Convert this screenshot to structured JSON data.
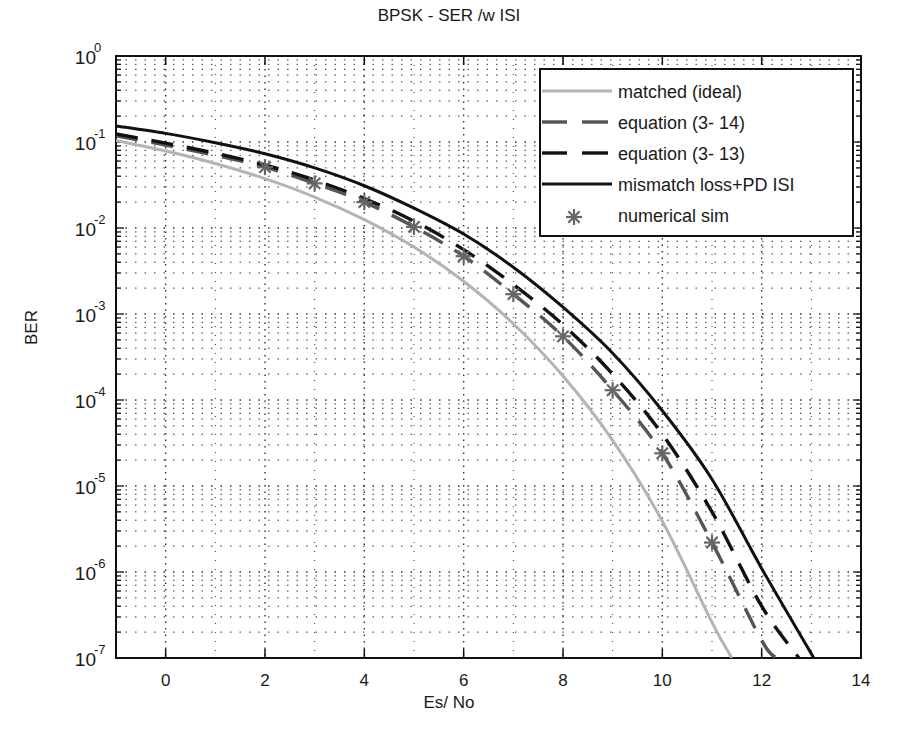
{
  "chart_data": {
    "type": "line",
    "title": "BPSK -  SER /w  ISI",
    "xlabel": "Es/ No",
    "ylabel": "BER",
    "xlim": [
      -1,
      14
    ],
    "ylim": [
      1e-07,
      1
    ],
    "yscale": "log",
    "grid": true,
    "legend_position": "upper right",
    "x_ticks": [
      0,
      2,
      4,
      6,
      8,
      10,
      12,
      14
    ],
    "x_tick_labels": [
      "0",
      "2",
      "4",
      "6",
      "8",
      "10",
      "12",
      "14"
    ],
    "y_ticks": [
      1,
      0.1,
      0.01,
      0.001,
      0.0001,
      1e-05,
      1e-06,
      1e-07
    ],
    "y_tick_labels": [
      {
        "base": "10",
        "exp": "0"
      },
      {
        "base": "10",
        "exp": "-1"
      },
      {
        "base": "10",
        "exp": "-2"
      },
      {
        "base": "10",
        "exp": "-3"
      },
      {
        "base": "10",
        "exp": "-4"
      },
      {
        "base": "10",
        "exp": "-5"
      },
      {
        "base": "10",
        "exp": "-6"
      },
      {
        "base": "10",
        "exp": "-7"
      }
    ],
    "series": [
      {
        "name": "matched (ideal)",
        "style": "solid",
        "color": "#b4b4b4",
        "x": [
          -1,
          0,
          1,
          2,
          3,
          4,
          5,
          6,
          7,
          8,
          9,
          10,
          11,
          11.4
        ],
        "values": [
          0.104,
          0.0786,
          0.0563,
          0.0375,
          0.0229,
          0.0125,
          0.006,
          0.0024,
          0.00077,
          0.00019,
          3.4e-05,
          3.9e-06,
          2.6e-07,
          1e-07
        ]
      },
      {
        "name": "equation (3- 14)",
        "style": "dashed",
        "color": "#555555",
        "x": [
          -1,
          0,
          1,
          2,
          3,
          4,
          5,
          6,
          7,
          8,
          9,
          10,
          11,
          12,
          12.3
        ],
        "values": [
          0.118,
          0.092,
          0.07,
          0.051,
          0.033,
          0.02,
          0.0103,
          0.0047,
          0.0017,
          0.00055,
          0.00013,
          2.4e-05,
          2.2e-06,
          1.6e-07,
          1e-07
        ]
      },
      {
        "name": "equation (3- 13)",
        "style": "dashed",
        "color": "#111111",
        "x": [
          -1,
          0,
          1,
          2,
          3,
          4,
          5,
          6,
          7,
          8,
          9,
          10,
          11,
          12,
          12.75
        ],
        "values": [
          0.124,
          0.097,
          0.074,
          0.054,
          0.036,
          0.022,
          0.012,
          0.0056,
          0.0022,
          0.00075,
          0.0002,
          4e-05,
          5e-06,
          4e-07,
          1e-07
        ]
      },
      {
        "name": "mismatch loss+PD ISI",
        "style": "solid",
        "color": "#111111",
        "x": [
          -1,
          0,
          1,
          2,
          3,
          4,
          5,
          6,
          7,
          8,
          9,
          10,
          11,
          12,
          13.05
        ],
        "values": [
          0.154,
          0.126,
          0.098,
          0.073,
          0.05,
          0.031,
          0.017,
          0.0085,
          0.0035,
          0.0012,
          0.00035,
          7.5e-05,
          1.2e-05,
          1.1e-06,
          1e-07
        ]
      },
      {
        "name": "numerical sim",
        "style": "marker-star",
        "color": "#666666",
        "x": [
          2,
          3,
          4,
          5,
          6,
          7,
          8,
          9,
          10,
          11
        ],
        "values": [
          0.051,
          0.033,
          0.02,
          0.0103,
          0.0047,
          0.0017,
          0.00055,
          0.00013,
          2.4e-05,
          2.2e-06
        ]
      }
    ]
  }
}
